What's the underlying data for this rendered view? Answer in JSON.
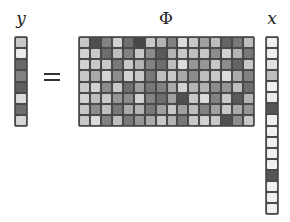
{
  "labels": {
    "y": "y",
    "phi": "Φ",
    "x": "x",
    "equals": "="
  },
  "vectors": {
    "y": [
      200,
      235,
      105,
      130,
      95,
      220,
      110,
      215
    ],
    "x": [
      240,
      240,
      225,
      190,
      240,
      235,
      85,
      240,
      240,
      240,
      240,
      240,
      85,
      240,
      240,
      240
    ]
  },
  "matrix_phi": [
    [
      200,
      80,
      130,
      210,
      110,
      70,
      200,
      180,
      130,
      220,
      200,
      160,
      190,
      100,
      120,
      190
    ],
    [
      210,
      200,
      110,
      190,
      130,
      200,
      140,
      90,
      180,
      200,
      190,
      200,
      140,
      210,
      180,
      120
    ],
    [
      210,
      200,
      200,
      120,
      200,
      180,
      130,
      110,
      190,
      220,
      150,
      150,
      200,
      140,
      100,
      200
    ],
    [
      200,
      170,
      210,
      140,
      210,
      200,
      120,
      190,
      200,
      170,
      140,
      190,
      200,
      220,
      170,
      130
    ],
    [
      200,
      210,
      140,
      200,
      110,
      160,
      120,
      130,
      170,
      210,
      180,
      180,
      140,
      150,
      190,
      110
    ],
    [
      210,
      190,
      200,
      150,
      140,
      210,
      130,
      110,
      160,
      80,
      200,
      220,
      130,
      200,
      90,
      180
    ],
    [
      200,
      140,
      190,
      120,
      170,
      180,
      120,
      160,
      200,
      160,
      190,
      130,
      160,
      200,
      170,
      150
    ],
    [
      200,
      220,
      130,
      190,
      120,
      150,
      170,
      200,
      180,
      120,
      200,
      210,
      200,
      80,
      140,
      200
    ]
  ]
}
